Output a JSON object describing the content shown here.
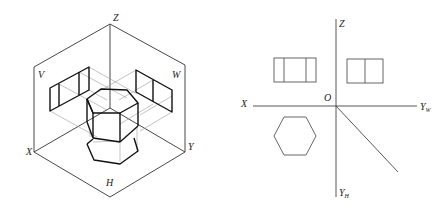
{
  "left_figure": {
    "type": "isometric three-plane projection",
    "labels": {
      "z": "Z",
      "x": "X",
      "y": "Y",
      "v_plane": "V",
      "w_plane": "W",
      "h_plane": "H"
    },
    "object": "hexagonal prism"
  },
  "right_figure": {
    "type": "orthographic three-view drawing",
    "labels": {
      "z": "Z",
      "x": "X",
      "origin": "O",
      "yw_main": "Y",
      "yw_sub": "W",
      "yh_main": "Y",
      "yh_sub": "H"
    },
    "views": [
      "front view (rectangle with two inner lines)",
      "side view (rectangle with one inner line)",
      "top view (hexagon)"
    ]
  }
}
